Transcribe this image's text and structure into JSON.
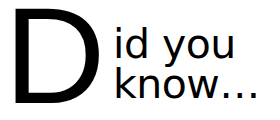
{
  "heading": {
    "drop_cap": "D",
    "line1": "id you",
    "line2": "know…",
    "full_text": "Did you know…"
  },
  "colors": {
    "text": "#000000",
    "background": "#ffffff"
  }
}
